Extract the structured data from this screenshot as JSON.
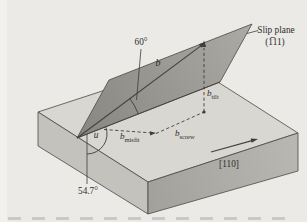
{
  "figure": {
    "kind": "slip-plane-burgers-vector-diagram",
    "labels": {
      "slip_plane_line1": "Slip plane",
      "slip_plane_line2": "(1̅11)",
      "angle_top": "60°",
      "angle_bottom": "54.7°",
      "burgers_vector": "b",
      "sub_tilt": "tilt",
      "sub_misfit": "misfit",
      "sub_screw": "screw",
      "line_direction": "u",
      "crystal_direction": "[110]"
    },
    "colors": {
      "background": "#ebeae6",
      "left_margin": "#f2f1ee",
      "top_face": "#d8d7d2",
      "front_left_face": "#c3c2bd",
      "front_right_face_start": "#a2a19c",
      "front_right_face_end": "#b8b7b2",
      "slip_plane_start": "#87867f",
      "slip_plane_end": "#abaaa5",
      "line": "#44423e",
      "text": "#2e2d29"
    }
  }
}
